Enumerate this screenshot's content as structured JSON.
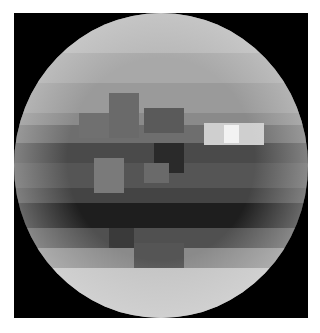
{
  "image": {
    "subject": "pixelated grayscale globe",
    "frame_color": "#000000",
    "background_color": "#ffffff",
    "cell_size": 10,
    "rows": [
      {
        "y": 0,
        "h": 40,
        "tones": [
          "#b8b8b8"
        ]
      },
      {
        "y": 40,
        "h": 30,
        "tones": [
          "#a8a8a8"
        ]
      },
      {
        "y": 70,
        "h": 30,
        "tones": [
          "#9a9a9a"
        ]
      },
      {
        "y": 100,
        "h": 12,
        "tones": [
          "#8a8a8a"
        ]
      },
      {
        "y": 112,
        "h": 18,
        "tones": [
          "#6e6e6e"
        ]
      },
      {
        "y": 130,
        "h": 20,
        "tones": [
          "#4a4a4a"
        ]
      },
      {
        "y": 150,
        "h": 25,
        "tones": [
          "#555555"
        ]
      },
      {
        "y": 175,
        "h": 15,
        "tones": [
          "#444444"
        ]
      },
      {
        "y": 190,
        "h": 25,
        "tones": [
          "#1e1e1e"
        ]
      },
      {
        "y": 215,
        "h": 20,
        "tones": [
          "#505050"
        ]
      },
      {
        "y": 235,
        "h": 20,
        "tones": [
          "#8a8a8a"
        ]
      },
      {
        "y": 255,
        "h": 50,
        "tones": [
          "#c4c4c4"
        ]
      }
    ],
    "features": [
      {
        "x": 95,
        "y": 80,
        "w": 30,
        "h": 45,
        "color": "#6a6a6a"
      },
      {
        "x": 65,
        "y": 100,
        "w": 30,
        "h": 25,
        "color": "#707070"
      },
      {
        "x": 130,
        "y": 95,
        "w": 40,
        "h": 25,
        "color": "#5a5a5a"
      },
      {
        "x": 190,
        "y": 110,
        "w": 60,
        "h": 22,
        "color": "#cfcfcf"
      },
      {
        "x": 210,
        "y": 112,
        "w": 15,
        "h": 18,
        "color": "#f2f2f2"
      },
      {
        "x": 140,
        "y": 130,
        "w": 30,
        "h": 30,
        "color": "#2a2a2a"
      },
      {
        "x": 80,
        "y": 145,
        "w": 30,
        "h": 35,
        "color": "#7a7a7a"
      },
      {
        "x": 130,
        "y": 150,
        "w": 25,
        "h": 20,
        "color": "#6a6a6a"
      },
      {
        "x": 120,
        "y": 230,
        "w": 50,
        "h": 25,
        "color": "#555555"
      },
      {
        "x": 95,
        "y": 215,
        "w": 25,
        "h": 20,
        "color": "#3a3a3a"
      }
    ]
  }
}
